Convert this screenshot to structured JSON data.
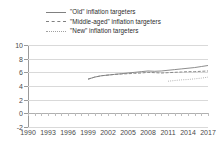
{
  "chart_data": {
    "type": "line",
    "title": "",
    "subtitle": "",
    "xlabel": "",
    "ylabel": "",
    "xlim": [
      1990,
      2017
    ],
    "ylim": [
      -2,
      10
    ],
    "ytick_labels": [
      "10",
      "8",
      "6",
      "4",
      "2",
      "0",
      "-2"
    ],
    "yticks": [
      10,
      8,
      6,
      4,
      2,
      0,
      -2
    ],
    "xtick_labels": [
      "1990",
      "1993",
      "1996",
      "1999",
      "2002",
      "2005",
      "2008",
      "2011",
      "2014",
      "2017"
    ],
    "xticks": [
      1990,
      1993,
      1996,
      1999,
      2002,
      2005,
      2008,
      2011,
      2014,
      2017
    ],
    "grid": true,
    "legend_position": "top",
    "x": [
      1999,
      2000,
      2001,
      2002,
      2003,
      2004,
      2005,
      2006,
      2007,
      2008,
      2009,
      2010,
      2011,
      2012,
      2013,
      2014,
      2015,
      2016,
      2017
    ],
    "series": [
      {
        "name": "\"Old\" inflation targeters",
        "style": "solid",
        "color": "#808080",
        "values": [
          5.0,
          5.3,
          5.5,
          5.6,
          5.7,
          5.8,
          5.9,
          6.0,
          6.1,
          6.2,
          6.15,
          6.2,
          6.3,
          6.4,
          6.5,
          6.6,
          6.7,
          6.85,
          7.0
        ]
      },
      {
        "name": "\"Middle-aged\" inflation targeters",
        "style": "dashed",
        "color": "#808080",
        "values": [
          5.0,
          5.3,
          5.5,
          5.6,
          5.7,
          5.75,
          5.8,
          5.85,
          5.9,
          6.0,
          5.95,
          5.9,
          5.95,
          6.0,
          6.05,
          6.1,
          6.1,
          6.15,
          6.2
        ]
      },
      {
        "name": "\"New\" inflation targeters",
        "style": "dotted",
        "color": "#a0a0a0",
        "values": [
          null,
          null,
          null,
          null,
          null,
          null,
          null,
          null,
          null,
          null,
          null,
          null,
          4.7,
          4.8,
          4.9,
          4.95,
          5.05,
          5.15,
          5.3
        ]
      }
    ]
  },
  "legend": {
    "items": [
      {
        "label": "\"Old\" inflation targeters",
        "style": "solid"
      },
      {
        "label": "\"Middle-aged\" inflation targeters",
        "style": "dashed"
      },
      {
        "label": "\"New\" inflation targeters",
        "style": "dotted"
      }
    ]
  }
}
